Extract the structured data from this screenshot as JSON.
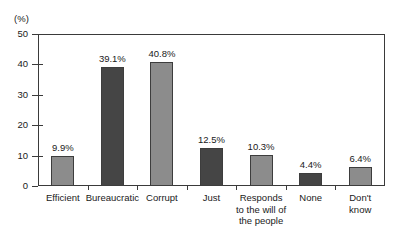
{
  "chart_data": {
    "type": "bar",
    "title": "",
    "subtitle": "",
    "xlabel": "",
    "ylabel": "(%)",
    "ylim": [
      0,
      50
    ],
    "ytick_labels": [
      "0",
      "10",
      "20",
      "30",
      "40",
      "50"
    ],
    "ytick_values": [
      0,
      10,
      20,
      30,
      40,
      50
    ],
    "grid": false,
    "legend": false,
    "legend_position": "none",
    "categories": [
      "Efficient",
      "Bureaucratic",
      "Corrupt",
      "Just",
      "Responds to the will of the people",
      "None",
      "Don't know"
    ],
    "category_label_lines": [
      [
        "Efficient"
      ],
      [
        "Bureaucratic"
      ],
      [
        "Corrupt"
      ],
      [
        "Just"
      ],
      [
        "Responds",
        "to the will of",
        "the people"
      ],
      [
        "None"
      ],
      [
        "Don't",
        "know"
      ]
    ],
    "values": [
      9.9,
      39.1,
      40.8,
      12.5,
      10.3,
      4.4,
      6.4
    ],
    "value_labels": [
      "9.9%",
      "39.1%",
      "40.8%",
      "12.5%",
      "10.3%",
      "4.4%",
      "6.4%"
    ],
    "bar_shades": [
      "light",
      "dark",
      "light",
      "dark",
      "light",
      "dark",
      "light"
    ],
    "colors": {
      "bar_light": "#8c8c8c",
      "bar_dark": "#454545",
      "bar_outline": "#3d3d3d",
      "axis": "#3a3a3a",
      "text": "#1a1a1a",
      "background": "#ffffff"
    }
  }
}
